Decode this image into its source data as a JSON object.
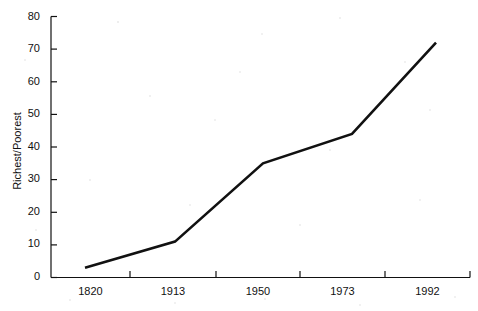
{
  "chart_data": {
    "type": "line",
    "title": "",
    "subtitle": "",
    "xlabel": "",
    "ylabel": "Richest/Poorest",
    "categories": [
      "1820",
      "1913",
      "1950",
      "1973",
      "1992"
    ],
    "values": [
      3,
      11,
      35,
      44,
      72
    ],
    "series": [
      {
        "name": "Richest/Poorest ratio",
        "values": [
          3,
          11,
          35,
          44,
          72
        ]
      }
    ],
    "ylim": [
      0,
      80
    ],
    "ytick_labels": [
      "0",
      "10",
      "20",
      "30",
      "40",
      "50",
      "60",
      "70",
      "80"
    ],
    "ytick_values": [
      0,
      10,
      20,
      30,
      40,
      50,
      60,
      70,
      80
    ],
    "xtick_labels": [
      "1820",
      "1913",
      "1950",
      "1973",
      "1992"
    ],
    "grid": false,
    "legend": "none",
    "line_color": "#111111",
    "background_color": "#ffffff",
    "axis_color": "#111111"
  },
  "axes": {
    "y_axis_title": "Richest/Poorest"
  }
}
